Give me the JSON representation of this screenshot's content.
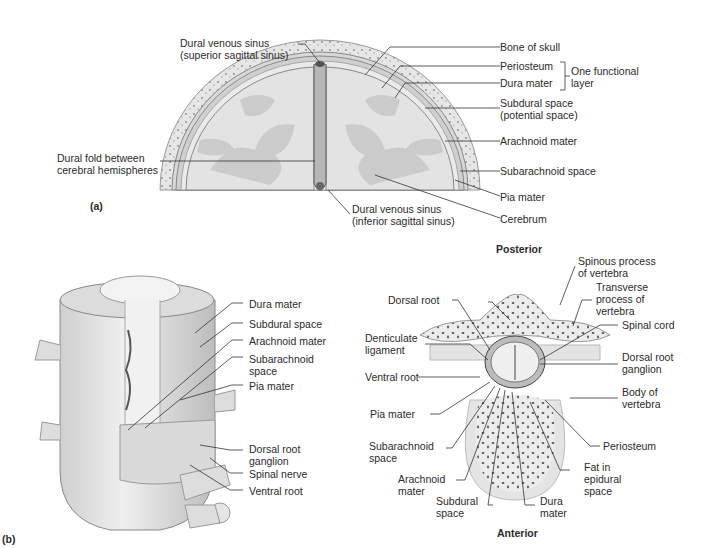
{
  "panel_a": {
    "tag": "(a)",
    "labels": {
      "dural_venous_sinus_sup": [
        "Dural venous sinus",
        "(superior sagittal sinus)"
      ],
      "dural_fold": [
        "Dural fold between",
        "cerebral hemispheres"
      ],
      "dural_venous_sinus_inf": [
        "Dural venous sinus",
        "(inferior sagittal sinus)"
      ],
      "bone_of_skull": "Bone of skull",
      "periosteum": "Periosteum",
      "dura_mater": "Dura mater",
      "one_functional_layer": [
        "One functional",
        "layer"
      ],
      "subdural_space": [
        "Subdural space",
        "(potential space)"
      ],
      "arachnoid_mater": "Arachnoid mater",
      "subarachnoid_space": "Subarachnoid space",
      "pia_mater": "Pia mater",
      "cerebrum": "Cerebrum"
    }
  },
  "panel_b": {
    "tag": "(b)",
    "left_labels": {
      "dura_mater": "Dura mater",
      "subdural_space": "Subdural space",
      "arachnoid_mater": "Arachnoid mater",
      "subarachnoid_space": [
        "Subarachnoid",
        "space"
      ],
      "pia_mater": "Pia mater",
      "dorsal_root_ganglion": [
        "Dorsal root",
        "ganglion"
      ],
      "spinal_nerve": "Spinal nerve",
      "ventral_root": "Ventral root"
    },
    "cross_section": {
      "posterior": "Posterior",
      "anterior": "Anterior",
      "spinous_process": [
        "Spinous process",
        "of vertebra"
      ],
      "transverse_process": [
        "Transverse",
        "process of",
        "vertebra"
      ],
      "spinal_cord": "Spinal cord",
      "dorsal_root_ganglion": [
        "Dorsal root",
        "ganglion"
      ],
      "body_of_vertebra": [
        "Body of",
        "vertebra"
      ],
      "periosteum": "Periosteum",
      "fat_in_epidural": [
        "Fat in",
        "epidural",
        "space"
      ],
      "dura_mater": [
        "Dura",
        "mater"
      ],
      "subdural_space": [
        "Subdural",
        "space"
      ],
      "arachnoid_mater": [
        "Arachnoid",
        "mater"
      ],
      "subarachnoid_space": [
        "Subarachnoid",
        "space"
      ],
      "pia_mater": "Pia mater",
      "ventral_root": "Ventral root",
      "denticulate_ligament": [
        "Denticulate",
        "ligament"
      ],
      "dorsal_root": "Dorsal root"
    }
  }
}
